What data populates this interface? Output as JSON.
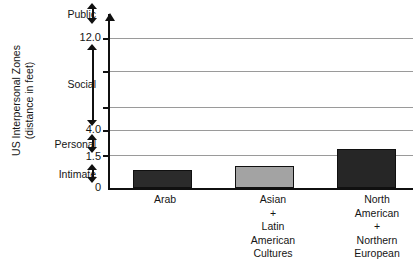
{
  "chart_data": {
    "type": "bar",
    "title": "",
    "subtitle": "",
    "ylabel_line1": "US Interpersonal Zones",
    "ylabel_line2": "(distance in feet)",
    "xlabel": "",
    "categories": [
      "Arab",
      "Asian + Latin American Cultures",
      "North American + Northern European"
    ],
    "category_lines": [
      [
        "Arab"
      ],
      [
        "Asian",
        "+",
        "Latin",
        "American",
        "Cultures"
      ],
      [
        "North",
        "American",
        "+",
        "Northern",
        "European"
      ]
    ],
    "values": [
      0.8,
      1.0,
      2.1
    ],
    "value_unit": "feet",
    "bar_colors": [
      "#2b2b2b",
      "#a3a3a3",
      "#262626"
    ],
    "bar_border_color": "#101010",
    "ylim": [
      0,
      14
    ],
    "grid": true,
    "gridline_count": 5,
    "legend": "none",
    "axis_tick_labels": [
      "12.0",
      "4.0",
      "1.5",
      "0"
    ],
    "axis_tick_values": [
      12.0,
      4.0,
      1.5,
      0
    ],
    "zones": [
      {
        "name": "Public",
        "upper": "above 12.0",
        "lower": "12.0"
      },
      {
        "name": "Social",
        "upper": "12.0",
        "lower": "4.0"
      },
      {
        "name": "Personal",
        "upper": "4.0",
        "lower": "1.5"
      },
      {
        "name": "Intimate",
        "upper": "1.5",
        "lower": "0"
      }
    ],
    "zone_names": [
      "Public",
      "Social",
      "Personal",
      "Intimate"
    ],
    "gridline_labels": [
      "12.0",
      "",
      "",
      "4.0",
      "1.5"
    ]
  },
  "axis": {
    "tick_12": "12.0",
    "tick_4": "4.0",
    "tick_1_5": "1.5",
    "tick_0": "0"
  },
  "zones": {
    "public": "Public",
    "social": "Social",
    "personal": "Personal",
    "intimate": "Intimate"
  },
  "ytitle": {
    "line1": "US Interpersonal Zones",
    "line2": "(distance in feet)"
  },
  "categories": {
    "c0_l0": "Arab",
    "c1_l0": "Asian",
    "c1_l1": "+",
    "c1_l2": "Latin",
    "c1_l3": "American",
    "c1_l4": "Cultures",
    "c2_l0": "North",
    "c2_l1": "American",
    "c2_l2": "+",
    "c2_l3": "Northern",
    "c2_l4": "European"
  },
  "colors": {
    "bar_dark": "#2b2b2b",
    "bar_gray": "#a3a3a3",
    "gridline": "#9a9a9a",
    "axis": "#101010",
    "text": "#151515",
    "background": "#ffffff"
  }
}
